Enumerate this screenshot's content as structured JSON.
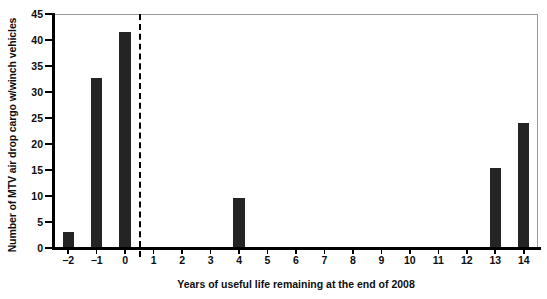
{
  "chart_data": {
    "type": "bar",
    "title": "",
    "xlabel": "Years of useful life remaining at the end of 2008",
    "ylabel": "Number of MTV air drop cargo w/winch vehicles",
    "categories": [
      "-2",
      "-1",
      "0",
      "1",
      "2",
      "3",
      "4",
      "5",
      "6",
      "7",
      "8",
      "9",
      "10",
      "11",
      "12",
      "13",
      "14"
    ],
    "values": [
      3,
      32.7,
      41.6,
      0,
      0,
      0,
      9.7,
      0,
      0,
      0,
      0,
      0,
      0,
      0,
      0,
      15.3,
      24.1
    ],
    "ylim": [
      0,
      45
    ],
    "yticks": [
      0,
      5,
      10,
      15,
      20,
      25,
      30,
      35,
      40,
      45
    ],
    "ytick_labels": [
      "0",
      "5",
      "10",
      "15",
      "20",
      "25",
      "30",
      "35",
      "40",
      "45"
    ],
    "xtick_labels": [
      "−2",
      "−1",
      "0",
      "1",
      "2",
      "3",
      "4",
      "5",
      "6",
      "7",
      "8",
      "9",
      "10",
      "11",
      "12",
      "13",
      "14"
    ],
    "grid": false,
    "legend": null,
    "bar_color": "#242424",
    "axis_color": "#000000",
    "frame_color": "#9a9a9a",
    "background": "#ffffff",
    "annotations": [
      {
        "name": "vertical-dashed-divider",
        "style": "dashed",
        "color": "#000000",
        "x_value": 0.5,
        "orientation": "vertical",
        "label": ""
      }
    ]
  }
}
